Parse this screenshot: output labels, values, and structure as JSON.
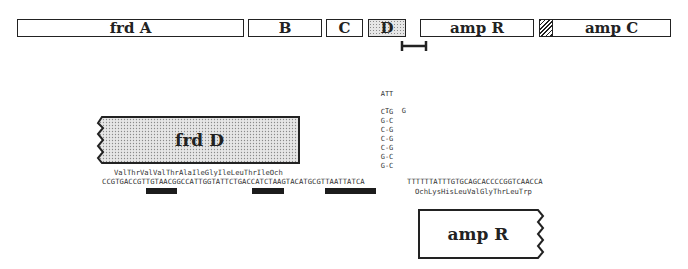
{
  "gene_map": {
    "genes": [
      {
        "id": "frdA",
        "label": "frd A",
        "fill": "plain"
      },
      {
        "id": "frdB",
        "label": "B",
        "fill": "plain"
      },
      {
        "id": "frdC",
        "label": "C",
        "fill": "plain"
      },
      {
        "id": "frdD",
        "label": "D",
        "fill": "stippled"
      },
      {
        "id": "ampR",
        "label": "amp R",
        "fill": "plain"
      },
      {
        "id": "ampC",
        "label": "amp C",
        "fill": "plain",
        "marker": "hatched-start"
      }
    ],
    "interval_marker": "expanded-region-bracket"
  },
  "detail": {
    "frdD_box": {
      "label": "frd D"
    },
    "ampR_box": {
      "label": "amp R"
    },
    "frdD_protein_end": "ValThrValValThrAlaIleGlyIleLeuThrIleOch",
    "dna_sequence_left": "CCGTGACCGTTGTAACGGCCATTGGTATTCTGACCATCTAAGTACATGCGTTAATTATCA",
    "dna_sequence_right": "TTTTTTATTTGTGCAGCACCCCGGTCAACCA",
    "ampR_protein_end": "OchLysHisLeuValGlyThrLeuTrp",
    "hairpin": {
      "loop_top": "ATT",
      "loop_left": "T",
      "loop_right": "G",
      "stem_pairs": [
        "C-G",
        "G-C",
        "C-G",
        "C-G",
        "C-G",
        "G-C",
        "G-C"
      ]
    },
    "underline_bars": 3
  }
}
